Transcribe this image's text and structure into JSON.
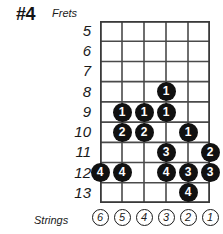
{
  "title": "#4",
  "captions": {
    "frets": "Frets",
    "strings": "Strings"
  },
  "colors": {
    "dot_fill": "#111111",
    "dot_text": "#ffffff",
    "grid_line": "#4a4a4a",
    "grid_border": "#3a3a3a",
    "text": "#1a1a1a",
    "background": "#ffffff"
  },
  "chart_data": {
    "type": "table",
    "title": "#4",
    "xlabel": "Strings",
    "ylabel": "Frets",
    "frets": [
      5,
      6,
      7,
      8,
      9,
      10,
      11,
      12,
      13
    ],
    "strings": [
      6,
      5,
      4,
      3,
      2,
      1
    ],
    "fret_labels": [
      "5",
      "6",
      "7",
      "8",
      "9",
      "10",
      "11",
      "12",
      "13"
    ],
    "string_labels": [
      "6",
      "5",
      "4",
      "3",
      "2",
      "1"
    ],
    "grid": true,
    "legend": "none",
    "notes": [
      {
        "fret": 8,
        "string": 3,
        "finger": "1"
      },
      {
        "fret": 9,
        "string": 5,
        "finger": "1"
      },
      {
        "fret": 9,
        "string": 4,
        "finger": "1"
      },
      {
        "fret": 9,
        "string": 3,
        "finger": "1"
      },
      {
        "fret": 10,
        "string": 5,
        "finger": "2"
      },
      {
        "fret": 10,
        "string": 4,
        "finger": "2"
      },
      {
        "fret": 10,
        "string": 2,
        "finger": "1"
      },
      {
        "fret": 11,
        "string": 3,
        "finger": "3"
      },
      {
        "fret": 11,
        "string": 1,
        "finger": "2"
      },
      {
        "fret": 12,
        "string": 6,
        "finger": "4"
      },
      {
        "fret": 12,
        "string": 5,
        "finger": "4"
      },
      {
        "fret": 12,
        "string": 3,
        "finger": "4"
      },
      {
        "fret": 12,
        "string": 2,
        "finger": "3"
      },
      {
        "fret": 12,
        "string": 1,
        "finger": "3"
      },
      {
        "fret": 13,
        "string": 2,
        "finger": "4"
      }
    ]
  }
}
